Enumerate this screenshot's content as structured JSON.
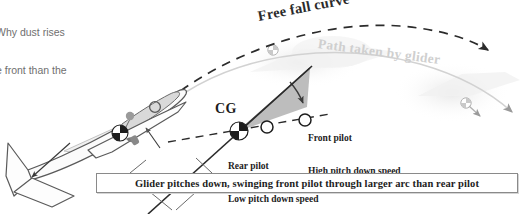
{
  "figure": {
    "type": "glider-pitch-down-physics-diagram",
    "background_color": "#ffffff"
  },
  "clipped_note": {
    "line1": "Why dust rises",
    "line2": "e front than the",
    "color": "#6f6f6f"
  },
  "labels": {
    "free_fall_curve": "Free fall curve",
    "path_taken_by_glider": "Path taken by glider",
    "cg": "CG",
    "front_pilot_line1": "Front pilot",
    "front_pilot_line2": "High pitch down speed",
    "rear_pilot_line1": "Rear pilot",
    "rear_pilot_line2": "Low pitch down speed"
  },
  "caption": {
    "text": "Glider pitches down, swinging front pilot through larger arc than rear pilot"
  },
  "colors": {
    "free_fall_curve": "#2b2b2b",
    "glider_path": "#cfcfcf",
    "wedge_fill": "#b9b9b9",
    "wedge_stroke": "#4a4a4a",
    "glider_outline": "#555555",
    "glider_fill": "#fbfbfb",
    "canopy_fill": "#d8d8d8",
    "caption_border": "#8a8a8a",
    "text_dark": "#1d1d1d",
    "ghost_glider": "#ededed"
  }
}
